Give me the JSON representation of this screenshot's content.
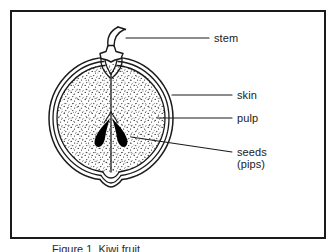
{
  "figure": {
    "type": "botanical-cross-section-diagram",
    "caption": "Figure 1  Kiwi fruit",
    "frame_color": "#1a1a1a",
    "background_color": "#ffffff",
    "ink_color": "#1a1a1a"
  },
  "labels": {
    "stem": "stem",
    "skin": "skin",
    "pulp": "pulp",
    "seeds": "seeds",
    "pips": "(pips)"
  },
  "parts": [
    {
      "name": "stem",
      "label": "stem",
      "leader_from": [
        126,
        38
      ],
      "leader_to": [
        208,
        38
      ],
      "description": "curved stalk rising from calyx at top of fruit"
    },
    {
      "name": "skin",
      "label": "skin",
      "leader_from": [
        172,
        95
      ],
      "leader_to": [
        232,
        95
      ],
      "description": "three concentric outline rings forming the outer rind"
    },
    {
      "name": "pulp",
      "label": "pulp",
      "leader_from": [
        157,
        118
      ],
      "leader_to": [
        232,
        118
      ],
      "description": "stippled flesh filling the interior"
    },
    {
      "name": "seeds",
      "label": "seeds (pips)",
      "leader_from": [
        132,
        137
      ],
      "leader_to": [
        232,
        152
      ],
      "description": "two solid black teardrop seeds flanking the central core"
    }
  ],
  "geometry": {
    "fruit_center": [
      111,
      118
    ],
    "fruit_radius_outer": 62,
    "fruit_radius_mid": 58,
    "fruit_radius_inner": 54,
    "seed_left": [
      96,
      135
    ],
    "seed_right": [
      126,
      135
    ],
    "core_axis_x": 111
  }
}
